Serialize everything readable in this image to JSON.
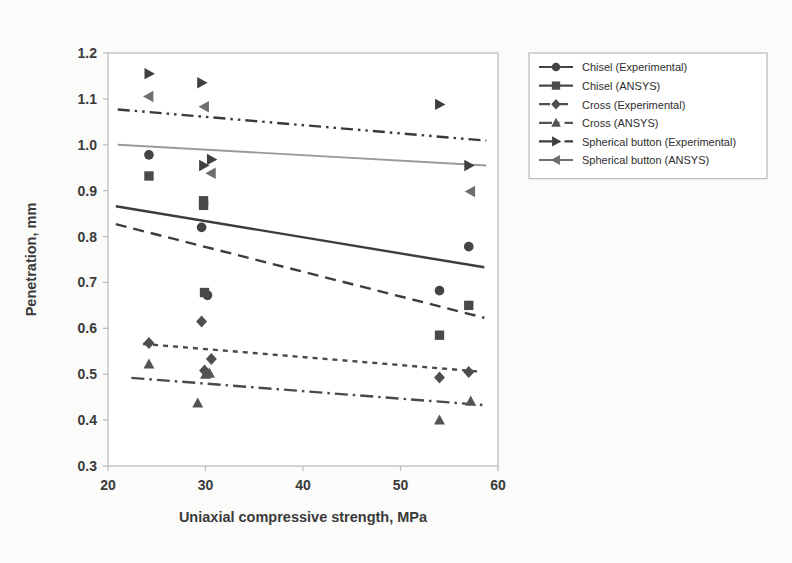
{
  "figure": {
    "background_color": "#fbfbfa",
    "plot_background_color": "#ffffff",
    "frame_color": "#b9b9b9"
  },
  "chart_data": {
    "type": "scatter",
    "title": "",
    "subtitle": "",
    "xlabel": "Uniaxial compressive strength, MPa",
    "ylabel": "Penetration, mm",
    "xlim": [
      20,
      60
    ],
    "ylim": [
      0.3,
      1.2
    ],
    "xticks": [
      20,
      30,
      40,
      50,
      60
    ],
    "xtick_labels": [
      "20",
      "30",
      "40",
      "50",
      "60"
    ],
    "yticks": [
      0.3,
      0.4,
      0.5,
      0.6,
      0.7,
      0.8,
      0.9,
      1.0,
      1.1,
      1.2
    ],
    "ytick_labels": [
      "0.3",
      "0.4",
      "0.5",
      "0.6",
      "0.7",
      "0.8",
      "0.9",
      "1.0",
      "1.1",
      "1.2"
    ],
    "grid": false,
    "legend_position": "right-top",
    "series": [
      {
        "name": "Chisel (Experimental)",
        "marker": "circle",
        "color": "#444444",
        "line_style": "solid",
        "line_color": "#3d3d3d",
        "points": [
          {
            "x": 24.2,
            "y": 0.978
          },
          {
            "x": 29.6,
            "y": 0.82
          },
          {
            "x": 30.2,
            "y": 0.672
          },
          {
            "x": 54.0,
            "y": 0.682
          },
          {
            "x": 57.0,
            "y": 0.778
          }
        ],
        "trend": {
          "x1": 20.8,
          "y1": 0.866,
          "x2": 58.6,
          "y2": 0.733
        }
      },
      {
        "name": "Chisel (ANSYS)",
        "marker": "square",
        "color": "#4a4a4a",
        "line_style": "dashed",
        "line_color": "#3d3d3d",
        "points": [
          {
            "x": 24.2,
            "y": 0.932
          },
          {
            "x": 29.8,
            "y": 0.878
          },
          {
            "x": 29.8,
            "y": 0.868
          },
          {
            "x": 29.9,
            "y": 0.678
          },
          {
            "x": 54.0,
            "y": 0.585
          },
          {
            "x": 57.0,
            "y": 0.65
          }
        ],
        "trend": {
          "x1": 20.8,
          "y1": 0.827,
          "x2": 58.6,
          "y2": 0.623
        }
      },
      {
        "name": "Cross (Experimental)",
        "marker": "diamond",
        "color": "#4f4f4f",
        "line_style": "dotted",
        "line_color": "#4a4a4a",
        "points": [
          {
            "x": 24.2,
            "y": 0.568
          },
          {
            "x": 29.6,
            "y": 0.615
          },
          {
            "x": 29.9,
            "y": 0.508
          },
          {
            "x": 30.6,
            "y": 0.533
          },
          {
            "x": 54.0,
            "y": 0.493
          },
          {
            "x": 57.0,
            "y": 0.505
          }
        ],
        "trend": {
          "x1": 23.6,
          "y1": 0.566,
          "x2": 58.0,
          "y2": 0.506
        }
      },
      {
        "name": "Cross (ANSYS)",
        "marker": "triangle-up",
        "color": "#545454",
        "line_style": "dashdot",
        "line_color": "#4a4a4a",
        "points": [
          {
            "x": 24.2,
            "y": 0.522
          },
          {
            "x": 29.2,
            "y": 0.437
          },
          {
            "x": 30.0,
            "y": 0.5
          },
          {
            "x": 30.4,
            "y": 0.502
          },
          {
            "x": 54.0,
            "y": 0.4
          },
          {
            "x": 57.2,
            "y": 0.441
          }
        ],
        "trend": {
          "x1": 22.4,
          "y1": 0.492,
          "x2": 58.4,
          "y2": 0.433
        }
      },
      {
        "name": "Spherical button (Experimental)",
        "marker": "triangle-right",
        "color": "#3f3f3f",
        "line_style": "dashdotdot",
        "line_color": "#3a3a3a",
        "points": [
          {
            "x": 24.2,
            "y": 1.155
          },
          {
            "x": 29.6,
            "y": 1.135
          },
          {
            "x": 29.8,
            "y": 0.955
          },
          {
            "x": 30.6,
            "y": 0.968
          },
          {
            "x": 54.0,
            "y": 1.088
          },
          {
            "x": 57.0,
            "y": 0.955
          }
        ],
        "trend": {
          "x1": 21.0,
          "y1": 1.077,
          "x2": 58.8,
          "y2": 1.009
        }
      },
      {
        "name": "Spherical button (ANSYS)",
        "marker": "triangle-left",
        "color": "#6e6e6e",
        "line_style": "solid",
        "line_color": "#9a9a9a",
        "points": [
          {
            "x": 24.2,
            "y": 1.105
          },
          {
            "x": 29.9,
            "y": 1.083
          },
          {
            "x": 30.6,
            "y": 0.938
          },
          {
            "x": 57.2,
            "y": 0.898
          }
        ],
        "trend": {
          "x1": 21.0,
          "y1": 1.0,
          "x2": 58.8,
          "y2": 0.955
        }
      }
    ]
  },
  "legend": {
    "border_color": "#b9b9b9",
    "items": [
      {
        "label": "Chisel (Experimental)",
        "marker": "circle",
        "line_style": "solid",
        "color": "#444444"
      },
      {
        "label": "Chisel (ANSYS)",
        "marker": "square",
        "line_style": "solid",
        "color": "#4a4a4a"
      },
      {
        "label": "Cross (Experimental)",
        "marker": "diamond",
        "line_style": "dashed",
        "color": "#4f4f4f"
      },
      {
        "label": "Cross (ANSYS)",
        "marker": "triangle-up",
        "line_style": "dashdot",
        "color": "#545454"
      },
      {
        "label": "Spherical button (Experimental)",
        "marker": "triangle-right",
        "line_style": "dashdot",
        "color": "#3f3f3f"
      },
      {
        "label": "Spherical button (ANSYS)",
        "marker": "triangle-left",
        "line_style": "solid",
        "color": "#6e6e6e"
      }
    ]
  }
}
